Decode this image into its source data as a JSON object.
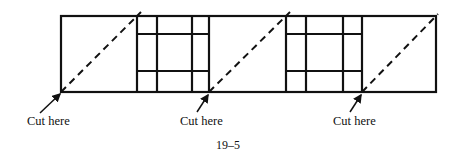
{
  "figure": {
    "caption": "19–5",
    "stroke_color": "#111111",
    "outer_rect": {
      "x": 61,
      "y": 16,
      "w": 375,
      "h": 76
    },
    "blocks": [
      {
        "verticals": [
          137,
          157,
          192,
          209
        ],
        "horizontals": [
          34,
          71
        ]
      },
      {
        "verticals": [
          286,
          306,
          343,
          362
        ],
        "horizontals": [
          34,
          71
        ]
      }
    ],
    "cut_lines": [
      {
        "from": [
          61,
          92
        ],
        "to": [
          141,
          12
        ]
      },
      {
        "from": [
          209,
          92
        ],
        "to": [
          290,
          12
        ]
      },
      {
        "from": [
          362,
          92
        ],
        "to": [
          438,
          14
        ]
      }
    ],
    "labels": [
      {
        "text": "Cut here",
        "x": 27,
        "y": 114,
        "arrow_from": [
          40,
          113
        ],
        "arrow_to": [
          60,
          94
        ]
      },
      {
        "text": "Cut here",
        "x": 180,
        "y": 114,
        "arrow_from": [
          197,
          112
        ],
        "arrow_to": [
          208,
          95
        ]
      },
      {
        "text": "Cut here",
        "x": 333,
        "y": 114,
        "arrow_from": [
          350,
          112
        ],
        "arrow_to": [
          361,
          95
        ]
      }
    ]
  }
}
